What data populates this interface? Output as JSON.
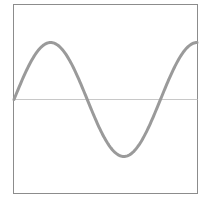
{
  "chart_data": {
    "type": "line",
    "title": "",
    "xlabel": "",
    "ylabel": "",
    "grid": false,
    "legend": null,
    "series": [
      {
        "name": "sine wave",
        "function": "sin",
        "description": "Single sine wave starting at zero, rising to a peak, falling to a trough, and rising back near the peak at the right edge (~1.25 periods)",
        "color": "#9a9a9a"
      }
    ],
    "baseline": {
      "y": 0,
      "color": "#c8c8c8"
    },
    "xlim": [
      0,
      7.85
    ],
    "ylim": [
      -1.7,
      1.7
    ],
    "x": [
      0,
      0.785,
      1.571,
      2.356,
      3.142,
      3.927,
      4.712,
      5.498,
      6.283,
      7.069,
      7.854
    ],
    "values": [
      0,
      0.707,
      1,
      0.707,
      0,
      -0.707,
      -1,
      -0.707,
      0,
      0.707,
      1
    ]
  },
  "colors": {
    "frame": "#8c8c8c",
    "curve": "#9a9a9a",
    "baseline": "#c8c8c8",
    "background": "#ffffff"
  }
}
